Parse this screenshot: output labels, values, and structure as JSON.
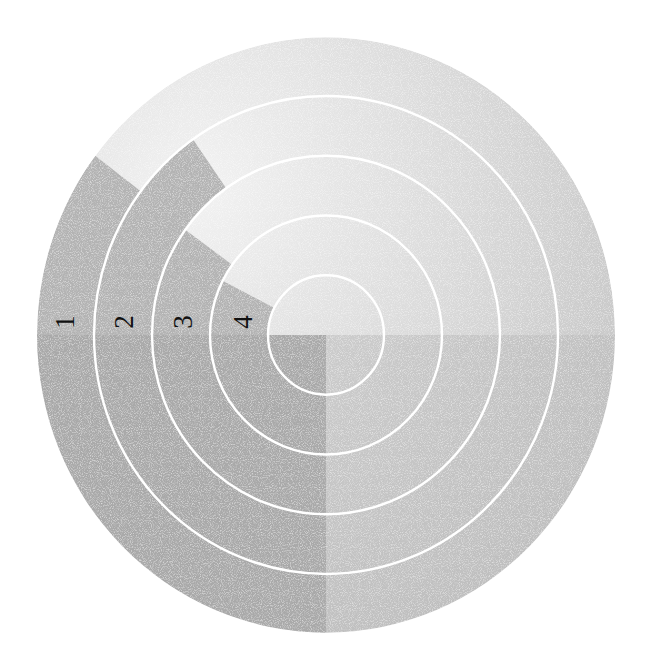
{
  "chart_data": {
    "type": "radial_bar",
    "title": "",
    "categories": [
      "1",
      "2",
      "3",
      "4"
    ],
    "values_degrees": [
      37,
      55,
      36,
      27
    ],
    "ring_order": "1 = outermost ring, 4 = innermost ring",
    "baseline": "horizontal line at 9 o'clock (left of centre)",
    "grid": "white concentric circle separators",
    "legend": "none",
    "axis_labels": {
      "x": "",
      "y": ""
    }
  },
  "geometry": {
    "cx": 326,
    "cy": 335,
    "outer_r": 289,
    "y_scale": 1.03,
    "ring_radii": [
      232,
      174,
      116,
      58
    ]
  },
  "colors": {
    "background": "#ffffff",
    "disc_light": "#ececec",
    "disc_mid": "#cbcbcb",
    "lower_left_quadrant": "#a9a9a9",
    "wedge_fill": "#b3b3b3",
    "separator": "#ffffff",
    "label": "#111111"
  },
  "labels": {
    "ring_1": "1",
    "ring_2": "2",
    "ring_3": "3",
    "ring_4": "4"
  }
}
